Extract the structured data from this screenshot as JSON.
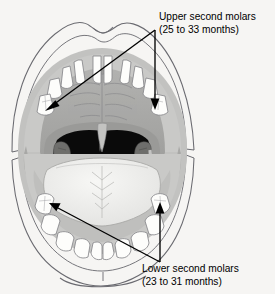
{
  "figure": {
    "background_color": "#f6f5f3"
  },
  "annotations": [
    {
      "id": "upper-second-molars",
      "line1": "Upper second molars",
      "line2": "(25 to 33 months)",
      "position": "top-right",
      "points_to": [
        "upper-left-second-molar",
        "upper-right-second-molar"
      ]
    },
    {
      "id": "lower-second-molars",
      "line1": "Lower second molars",
      "line2": "(23 to 31 months)",
      "position": "bottom-right",
      "points_to": [
        "lower-left-second-molar",
        "lower-right-second-molar"
      ]
    }
  ],
  "anatomy": {
    "parts": [
      {
        "name": "upper-lip",
        "color": "#fbfaf8"
      },
      {
        "name": "lower-lip",
        "color": "#fbfaf8"
      },
      {
        "name": "upper-gum",
        "color": "#c9c9c7"
      },
      {
        "name": "lower-gum",
        "color": "#c9c9c7"
      },
      {
        "name": "hard-palate",
        "color": "#a6a6a4"
      },
      {
        "name": "soft-palate",
        "color": "#9a9a98"
      },
      {
        "name": "uvula",
        "color": "#b4b4b2"
      },
      {
        "name": "oropharynx",
        "color": "#0a0a0a"
      },
      {
        "name": "left-tonsil",
        "color": "#6f6f6d"
      },
      {
        "name": "right-tonsil",
        "color": "#6f6f6d"
      },
      {
        "name": "tongue",
        "color": "#eeeeec"
      },
      {
        "name": "teeth",
        "color": "#fdfdfb"
      }
    ],
    "teeth_count": {
      "upper": 10,
      "lower": 10
    }
  },
  "colors": {
    "outline": "#55555a",
    "arrow": "#000000",
    "text": "#000000",
    "tooth_fill": "#fdfdfb",
    "tooth_stroke": "#86868a",
    "gum": "#c9c9c7",
    "palate": "#a6a6a4",
    "throat": "#0a0a0a",
    "tongue": "#eeeeec",
    "background": "#f6f5f3"
  }
}
